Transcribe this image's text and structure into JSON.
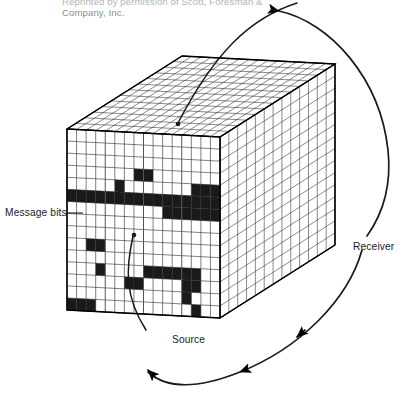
{
  "figure": {
    "type": "isometric-cube-bit-array-diagram",
    "width": 404,
    "height": 406,
    "background_color": "#ffffff",
    "line_color": "#000000",
    "cell_fill_color": "#1a1a1a",
    "cell_empty_color": "#ffffff",
    "credit": {
      "line1": "Reprinted by permission of Scott, Foresman &",
      "line2": "Company, Inc."
    },
    "labels": {
      "message_bits": "Message bits",
      "receiver": "Receiver",
      "source": "Source"
    },
    "cube": {
      "front_face": {
        "origin_x": 67,
        "origin_y": 129,
        "cols": 16,
        "rows": 15,
        "cell_w": 9.6,
        "cell_h": 12.0,
        "skew_y_per_col": 0.55,
        "filled_cells": [
          [
            3,
            7
          ],
          [
            3,
            8
          ],
          [
            4,
            5
          ],
          [
            5,
            0
          ],
          [
            5,
            1
          ],
          [
            5,
            2
          ],
          [
            5,
            3
          ],
          [
            5,
            4
          ],
          [
            5,
            5
          ],
          [
            5,
            6
          ],
          [
            5,
            7
          ],
          [
            5,
            8
          ],
          [
            5,
            9
          ],
          [
            5,
            10
          ],
          [
            5,
            11
          ],
          [
            5,
            12
          ],
          [
            5,
            13
          ],
          [
            5,
            14
          ],
          [
            5,
            15
          ],
          [
            4,
            13
          ],
          [
            4,
            14
          ],
          [
            4,
            15
          ],
          [
            6,
            10
          ],
          [
            6,
            11
          ],
          [
            6,
            12
          ],
          [
            6,
            13
          ],
          [
            6,
            14
          ],
          [
            6,
            15
          ],
          [
            9,
            2
          ],
          [
            9,
            3
          ],
          [
            11,
            3
          ],
          [
            11,
            8
          ],
          [
            11,
            9
          ],
          [
            11,
            10
          ],
          [
            11,
            11
          ],
          [
            11,
            12
          ],
          [
            11,
            13
          ],
          [
            12,
            6
          ],
          [
            12,
            7
          ],
          [
            12,
            12
          ],
          [
            12,
            13
          ],
          [
            13,
            12
          ],
          [
            14,
            0
          ],
          [
            14,
            1
          ],
          [
            14,
            2
          ],
          [
            14,
            13
          ]
        ]
      },
      "top_face": {
        "cols": 16,
        "rows": 13,
        "depth_dx": 115,
        "depth_dy": -73
      },
      "right_face": {
        "cols": 13,
        "rows": 15
      }
    },
    "annotations": [
      {
        "name": "message-bits-leader",
        "target_label": "Message bits",
        "style": "straight-line"
      },
      {
        "name": "source-leader",
        "target_label": "Source",
        "style": "curved-line-with-dot"
      },
      {
        "name": "top-face-leader",
        "style": "curved-line-with-dot"
      },
      {
        "name": "receiver-loop",
        "target_label": "Receiver",
        "style": "large-ellipse-with-two-arrowheads",
        "direction": "counter-clockwise"
      }
    ]
  }
}
